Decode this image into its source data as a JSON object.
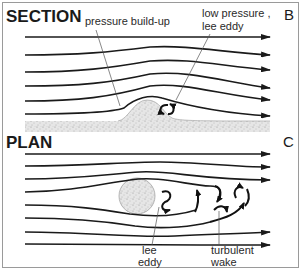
{
  "section": {
    "heading": "SECTION",
    "panel_letter": "B",
    "labels": {
      "pressure": "pressure build-up",
      "low_pressure_line1": "low pressure ,",
      "low_pressure_line2": "lee eddy"
    }
  },
  "plan": {
    "heading": "PLAN",
    "panel_letter": "C",
    "labels": {
      "lee_line1": "lee",
      "lee_line2": "eddy",
      "wake_line1": "turbulent",
      "wake_line2": "wake"
    }
  },
  "colors": {
    "ink": "#1a1a1a",
    "sediment": "#d8d8d8",
    "border": "#9a9a9a"
  }
}
